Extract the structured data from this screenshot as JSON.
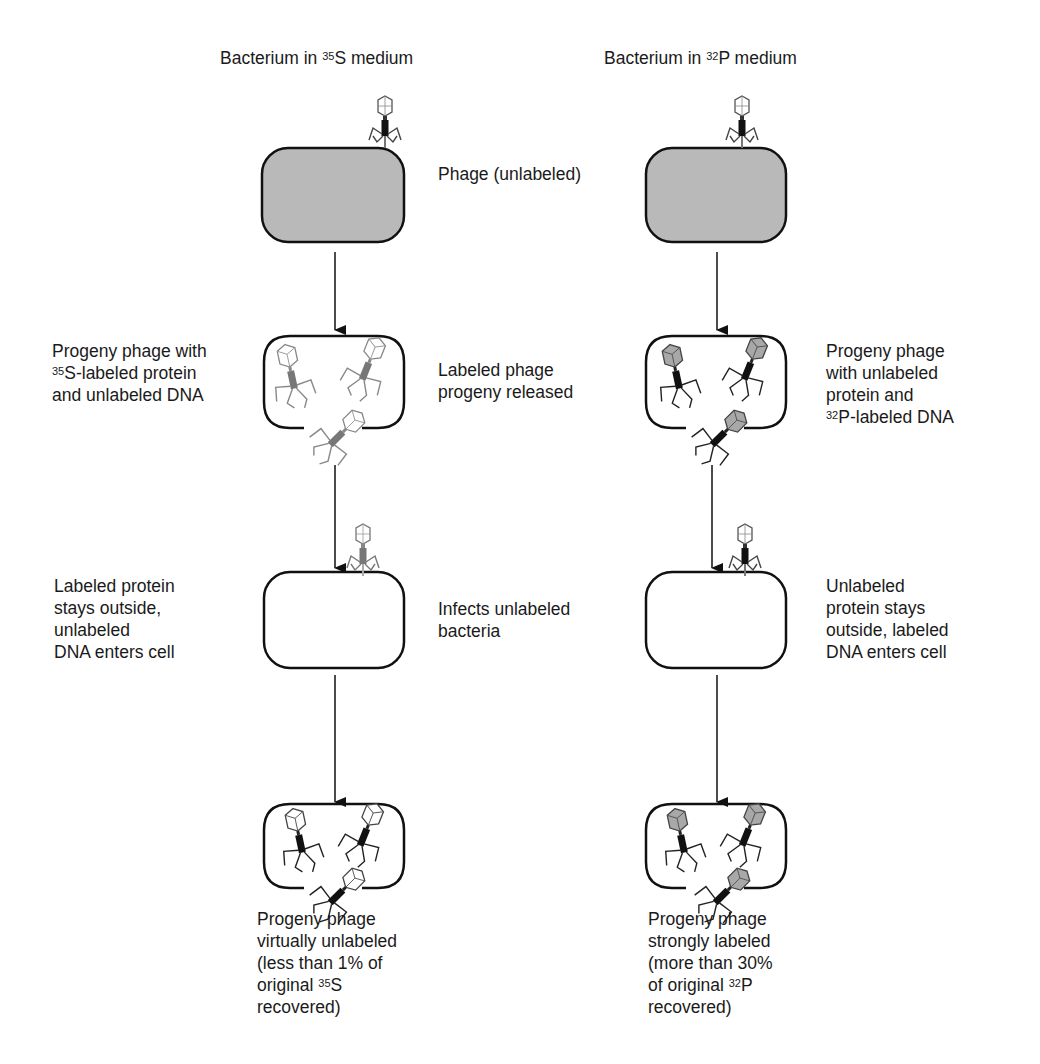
{
  "headers": {
    "left": {
      "prefix": "Bacterium in ",
      "isotope_mass": "35",
      "isotope_symbol": "S",
      "suffix": " medium"
    },
    "right": {
      "prefix": "Bacterium in ",
      "isotope_mass": "32",
      "isotope_symbol": "P",
      "suffix": " medium"
    }
  },
  "center_labels": {
    "step1": "Phage (unlabeled)",
    "step2": "Labeled phage\nprogeny released",
    "step3": "Infects unlabeled\nbacteria"
  },
  "left_labels": {
    "step2": {
      "line1": "Progeny phage with",
      "isotope_mass": "35",
      "line2_rest": "S-labeled protein",
      "line3": "and unlabeled DNA"
    },
    "step3": "Labeled protein\nstays outside,\nunlabeled\nDNA enters cell",
    "result": {
      "line1": "Progeny phage",
      "line2": "virtually unlabeled",
      "line3": "(less than 1% of",
      "line4_prefix": "original ",
      "isotope_mass": "35",
      "isotope_symbol": "S",
      "line5": "recovered)"
    }
  },
  "right_labels": {
    "step2": {
      "line1": "Progeny phage",
      "line2": "with unlabeled",
      "line3": "protein and",
      "isotope_mass": "32",
      "line4_rest": "P-labeled DNA"
    },
    "step3": "Unlabeled\nprotein stays\noutside, labeled\nDNA enters cell",
    "result": {
      "line1": "Progeny phage",
      "line2": "strongly labeled",
      "line3": "(more than 30%",
      "line4_prefix": "of original ",
      "isotope_mass": "32",
      "isotope_symbol": "P",
      "line5": "recovered)"
    }
  },
  "colors": {
    "cell_fill_labeled": "#b9b9b9",
    "cell_stroke": "#111111",
    "phage_gray": "#8a8a8a",
    "phage_dark": "#111111",
    "capsid_gray_fill": "#a8a8a8"
  }
}
